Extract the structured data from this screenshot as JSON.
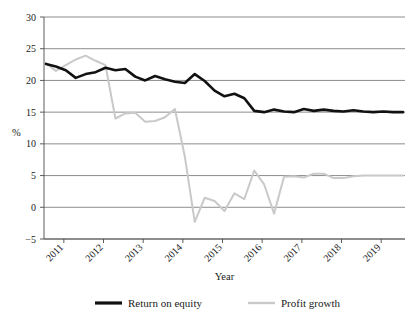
{
  "chart_data": {
    "type": "line",
    "title": "",
    "xlabel": "Year",
    "ylabel": "%",
    "ylim": [
      -5,
      30
    ],
    "yticks": [
      -5,
      0,
      5,
      10,
      15,
      20,
      25,
      30
    ],
    "ytick_labels": [
      "−5",
      "0",
      "5",
      "10",
      "15",
      "20",
      "25",
      "30"
    ],
    "categories": [
      "2011",
      "2012",
      "2013",
      "2014",
      "2015",
      "2016",
      "2017",
      "2018",
      "2019"
    ],
    "xtick_labels": [
      "2011",
      "2012",
      "2013",
      "2014",
      "2015",
      "2016",
      "2017",
      "2018",
      "2019"
    ],
    "xlim": [
      2010.5,
      2019.6
    ],
    "grid": "horizontal",
    "legend_position": "bottom",
    "series": [
      {
        "name": "Return on equity",
        "color": "#111111",
        "width": 2.6,
        "x": [
          2010.55,
          2010.8,
          2011.05,
          2011.3,
          2011.55,
          2011.8,
          2012.05,
          2012.3,
          2012.55,
          2012.8,
          2013.05,
          2013.3,
          2013.55,
          2013.8,
          2014.05,
          2014.3,
          2014.55,
          2014.8,
          2015.05,
          2015.3,
          2015.55,
          2015.8,
          2016.05,
          2016.3,
          2016.55,
          2016.8,
          2017.05,
          2017.3,
          2017.55,
          2017.8,
          2018.05,
          2018.3,
          2018.55,
          2018.8,
          2019.05,
          2019.3,
          2019.55
        ],
        "values": [
          22.6,
          22.2,
          21.6,
          20.4,
          21.0,
          21.3,
          22.0,
          21.6,
          21.8,
          20.6,
          20.0,
          20.7,
          20.2,
          19.8,
          19.6,
          21.0,
          19.9,
          18.4,
          17.5,
          17.9,
          17.2,
          15.2,
          15.0,
          15.4,
          15.1,
          15.0,
          15.5,
          15.2,
          15.4,
          15.2,
          15.1,
          15.3,
          15.1,
          15.0,
          15.1,
          15.0,
          15.0
        ]
      },
      {
        "name": "Profit growth",
        "color": "#c9c9c9",
        "width": 2.0,
        "x": [
          2010.55,
          2010.8,
          2011.05,
          2011.3,
          2011.55,
          2011.8,
          2012.05,
          2012.3,
          2012.55,
          2012.8,
          2013.05,
          2013.3,
          2013.55,
          2013.8,
          2014.05,
          2014.3,
          2014.55,
          2014.8,
          2015.05,
          2015.3,
          2015.55,
          2015.8,
          2016.05,
          2016.3,
          2016.55,
          2016.8,
          2017.05,
          2017.3,
          2017.55,
          2017.8,
          2018.05,
          2018.3,
          2018.55,
          2018.8,
          2019.05,
          2019.3,
          2019.55
        ],
        "values": [
          22.7,
          21.5,
          22.4,
          23.3,
          23.9,
          23.1,
          22.4,
          14.0,
          14.8,
          14.9,
          13.5,
          13.6,
          14.2,
          15.5,
          8.0,
          -2.3,
          1.5,
          1.0,
          -0.6,
          2.2,
          1.3,
          5.8,
          3.6,
          -1.0,
          4.8,
          4.9,
          4.7,
          5.3,
          5.3,
          4.6,
          4.6,
          4.9,
          5.0,
          5.0,
          5.0,
          5.0,
          5.0
        ]
      }
    ]
  },
  "legend": {
    "items": [
      {
        "label": "Return on equity",
        "color": "#111111",
        "width": 3.2
      },
      {
        "label": "Profit growth",
        "color": "#c9c9c9",
        "width": 2.4
      }
    ]
  }
}
